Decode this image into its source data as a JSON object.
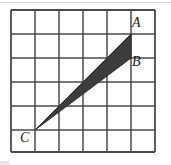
{
  "figure": {
    "type": "geometry-grid-diagram",
    "background_color": "#ffffff"
  },
  "grid": {
    "columns": 6,
    "rows": 6,
    "cell_size": 24,
    "origin_x": 11,
    "origin_y": 10,
    "line_color": "#4a4a4a",
    "line_width": 1.6,
    "border_color": "#3a3a3a",
    "border_width": 2
  },
  "shape": {
    "name": "triangle-ABC",
    "fill_color": "#3d3d3d",
    "stroke_color": "#2b2b2b",
    "vertices": [
      {
        "label": "A",
        "x": 131,
        "y": 34,
        "grid_x": 5,
        "grid_y": 1
      },
      {
        "label": "B",
        "x": 131,
        "y": 58,
        "grid_x": 5,
        "grid_y": 2
      },
      {
        "label": "C",
        "x": 35,
        "y": 130,
        "grid_x": 1,
        "grid_y": 5
      }
    ],
    "path": "131,34 131,58 35,130"
  },
  "labels": {
    "a": "A",
    "b": "B",
    "c": "C"
  }
}
